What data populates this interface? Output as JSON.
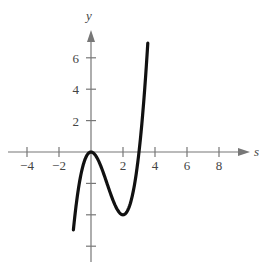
{
  "chart_data": {
    "type": "line",
    "title": "",
    "xlabel": "s",
    "ylabel": "y",
    "xlim": [
      -5,
      9.5
    ],
    "ylim": [
      -7,
      7.5
    ],
    "x_ticks": [
      -4,
      -2,
      2,
      4,
      6,
      8
    ],
    "x_tick_labels": [
      "−4",
      "−2",
      "2",
      "4",
      "6",
      "8"
    ],
    "y_ticks": [
      -6,
      -4,
      -2,
      2,
      4,
      6
    ],
    "y_tick_labels": [
      "",
      "",
      "",
      "2",
      "4",
      "6"
    ],
    "grid": false,
    "series": [
      {
        "name": "f(x) = x^3 - 3x^2",
        "x": [
          -1.1,
          -1.0,
          -0.75,
          -0.5,
          -0.25,
          0,
          0.5,
          1.0,
          1.5,
          2.0,
          2.5,
          3.0,
          3.25,
          3.5,
          3.55
        ],
        "y": [
          -4.96,
          -4.0,
          -2.11,
          -0.88,
          -0.2,
          0,
          -0.63,
          -2.0,
          -3.38,
          -4.0,
          -3.13,
          0,
          2.64,
          6.13,
          6.93
        ]
      }
    ],
    "annotations": [
      "relative maximum at (0, 0)",
      "relative minimum at (2, -4)"
    ]
  }
}
